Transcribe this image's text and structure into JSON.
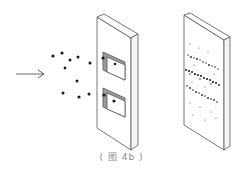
{
  "diagram": {
    "caption": "( 图 4b )",
    "colors": {
      "stroke": "#555555",
      "particle": "#1a1a1a",
      "slit_inner": "#9a9a9a",
      "background": "#ffffff"
    },
    "elements": {
      "arrow": {
        "label": "incoming direction",
        "from": [
          16,
          74
        ],
        "to": [
          44,
          74
        ]
      },
      "particles_incoming": [
        [
          53,
          56
        ],
        [
          62,
          53
        ],
        [
          70,
          60
        ],
        [
          78,
          57
        ],
        [
          65,
          68
        ],
        [
          90,
          63
        ],
        [
          77,
          81
        ],
        [
          63,
          93
        ],
        [
          79,
          97
        ],
        [
          89,
          94
        ]
      ],
      "barrier": {
        "label": "barrier with two slits",
        "slits": 2
      },
      "particles_at_slits": [
        [
          103,
          58
        ],
        [
          115,
          64
        ],
        [
          104,
          95
        ],
        [
          114,
          101
        ]
      ],
      "screen": {
        "label": "detection screen",
        "bands": 3
      }
    }
  }
}
